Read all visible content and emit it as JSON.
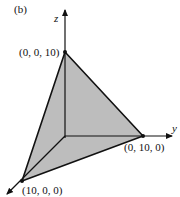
{
  "figure": {
    "panel_label": "(b)",
    "axes": {
      "x": "x",
      "y": "y",
      "z": "z"
    },
    "points": {
      "z_intercept": "(0, 0, 10)",
      "y_intercept": "(0, 10, 0)",
      "x_intercept": "(10, 0, 0)"
    },
    "colors": {
      "plane_fill": "#bdbdbd",
      "line": "#111111"
    }
  }
}
